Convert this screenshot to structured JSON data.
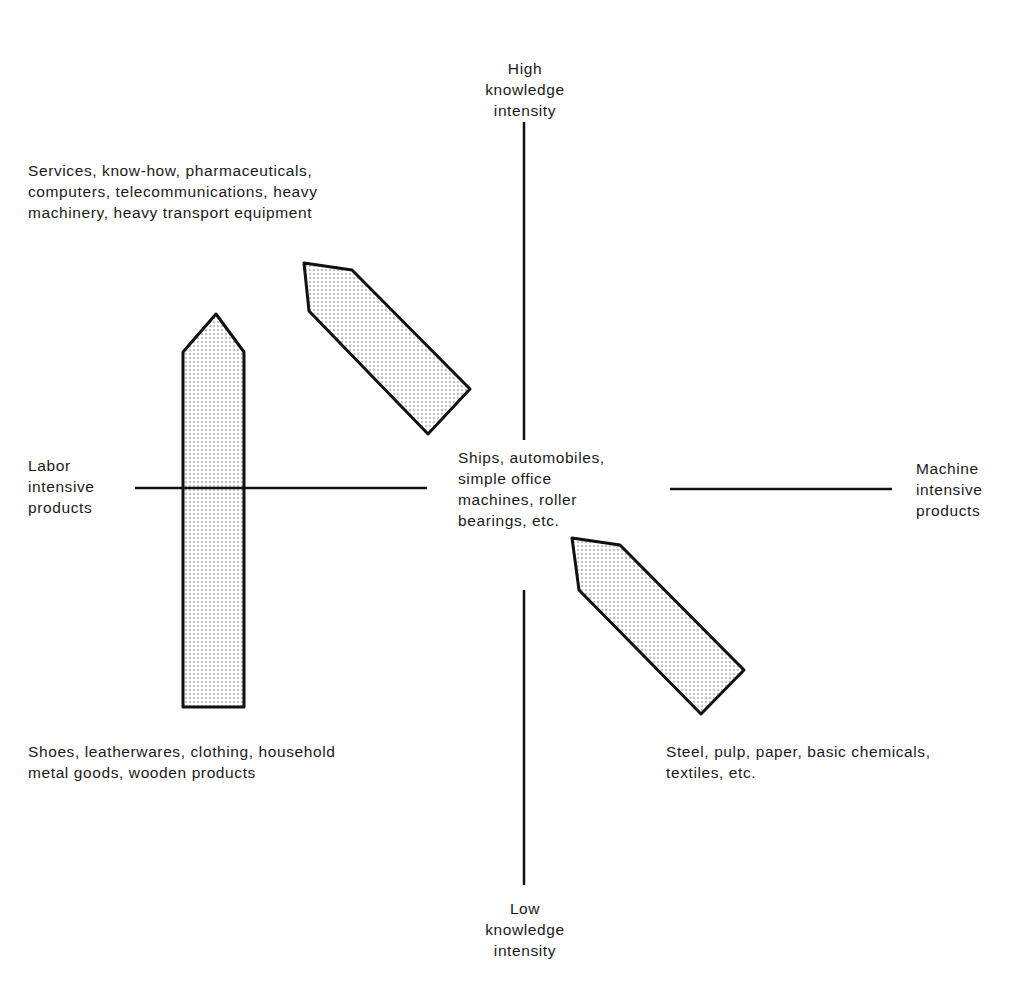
{
  "diagram": {
    "axes": {
      "top": "High\nknowledge\nintensity",
      "bottom": "Low\nknowledge\nintensity",
      "left": "Labor\nintensive\nproducts",
      "right": "Machine\nintensive\nproducts"
    },
    "quadrant_labels": {
      "upper_left": "Services, know-how, pharmaceuticals,\ncomputers, telecommunications, heavy\nmachinery, heavy transport equipment",
      "center": "Ships, automobiles,\nsimple office\nmachines, roller\nbearings, etc.",
      "lower_left": "Shoes, leatherwares, clothing, household\nmetal goods, wooden products",
      "lower_right": "Steel, pulp, paper, basic chemicals,\ntextiles, etc."
    },
    "arrows": [
      {
        "name": "labor-to-high-knowledge-arrow",
        "direction": "up",
        "points": "216,314 244,352 244,707 183,707 183,352"
      },
      {
        "name": "center-to-upper-left-arrow",
        "direction": "up-left",
        "points": "304,263 352,270 470,389 428,434 309,311"
      },
      {
        "name": "center-to-lower-right-arrow",
        "direction": "up-left",
        "points": "572,538 620,545 744,670 701,714 579,590"
      }
    ],
    "colors": {
      "line": "#111111",
      "fill_dot": "#777777",
      "background": "#ffffff"
    }
  }
}
